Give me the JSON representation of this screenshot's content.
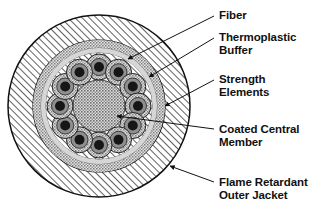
{
  "figure": {
    "type": "technical-cross-section-diagram",
    "background_color": "#ffffff",
    "line_color": "#111111"
  },
  "cable": {
    "center": {
      "x": 99,
      "y": 106
    },
    "layers": [
      {
        "id": "outer-jacket",
        "name": "Flame Retardant Outer Jacket",
        "shape": "annulus",
        "outer_radius": 91,
        "inner_radius": 66,
        "fill": "diagonal-hatch",
        "fill_color": "#ffffff",
        "hatch_color": "#333333"
      },
      {
        "id": "strength-elements-ring",
        "name": "Strength Elements",
        "shape": "annulus",
        "outer_radius": 66,
        "inner_radius": 58,
        "fill": "stipple",
        "fill_color": "#cfcfcf"
      },
      {
        "id": "thermoplastic-buffer-ring",
        "name": "Thermoplastic Buffer",
        "shape": "annulus",
        "outer_radius": 58,
        "inner_radius": 53,
        "fill": "solid",
        "fill_color": "#d8d8d8"
      },
      {
        "id": "inner-core-field",
        "name": "Inner core hatched field",
        "shape": "disc",
        "outer_radius": 53,
        "fill": "diagonal-hatch",
        "fill_color": "#ffffff",
        "hatch_color": "#333333"
      },
      {
        "id": "coated-central-member",
        "name": "Coated Central Member",
        "shape": "disc",
        "outer_radius": 26,
        "fill": "stipple",
        "fill_color": "#c6c6c6"
      }
    ],
    "fibers": {
      "count": 12,
      "ring_radius": 39,
      "start_angle_deg": -90,
      "outer_radius": 13,
      "mid_radius": 8.5,
      "core_radius": 5,
      "outer_fill": "#cfcfcf",
      "mid_fill": "#8f8f8f",
      "core_fill": "#161616",
      "stroke": "#222222"
    }
  },
  "callouts": [
    {
      "id": "fiber",
      "lines": [
        "Fiber"
      ],
      "text_x": 219,
      "text_y": 9,
      "leader": {
        "x1": 214,
        "y1": 16,
        "x2": 128,
        "y2": 59
      },
      "arrow": true,
      "target": "fiber core"
    },
    {
      "id": "thermoplastic-buffer",
      "lines": [
        "Thermoplastic",
        "Buffer"
      ],
      "text_x": 219,
      "text_y": 31,
      "leader": {
        "x1": 214,
        "y1": 38,
        "x2": 149,
        "y2": 77
      },
      "arrow": true,
      "target": "thermoplastic buffer ring"
    },
    {
      "id": "strength-elements",
      "lines": [
        "Strength",
        "Elements"
      ],
      "text_x": 219,
      "text_y": 73,
      "leader": {
        "x1": 214,
        "y1": 80,
        "x2": 165,
        "y2": 106
      },
      "arrow": true,
      "target": "strength elements ring"
    },
    {
      "id": "coated-central-member",
      "lines": [
        "Coated Central",
        "Member"
      ],
      "text_x": 219,
      "text_y": 123,
      "leader": {
        "x1": 214,
        "y1": 129,
        "x2": 117,
        "y2": 116
      },
      "arrow": true,
      "target": "coated central member"
    },
    {
      "id": "flame-retardant-outer-jacket",
      "lines": [
        "Flame Retardant",
        "Outer Jacket"
      ],
      "text_x": 219,
      "text_y": 176,
      "leader": {
        "x1": 214,
        "y1": 182,
        "x2": 170,
        "y2": 166
      },
      "arrow": true,
      "target": "outer jacket"
    }
  ]
}
